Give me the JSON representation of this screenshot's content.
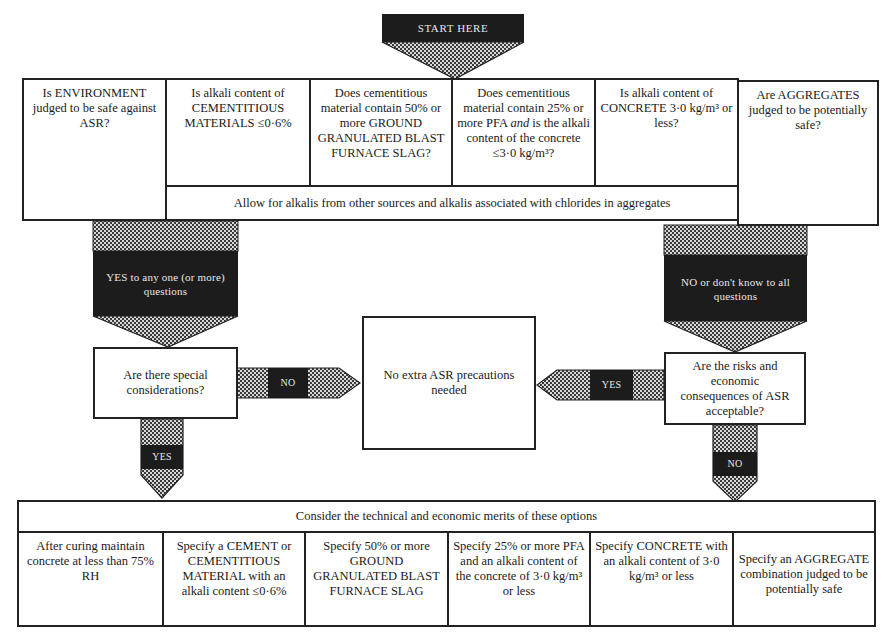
{
  "start": {
    "label": "START HERE"
  },
  "questions": [
    {
      "text": "Is ENVIRONMENT judged to be safe against ASR?"
    },
    {
      "text": "Is alkali content of CEMENTITIOUS MATERIALS ≤0·6%"
    },
    {
      "text": "Does cementitious material contain 50% or more GROUND GRANULATED BLAST FURNACE SLAG?"
    },
    {
      "text_before": "Does cementitious material contain 25% or more PFA ",
      "text_italic": "and",
      "text_after": " is the alkali content of the concrete ≤3·0 kg/m³?"
    },
    {
      "text": "Is alkali content of CONCRETE 3·0 kg/m³ or less?"
    },
    {
      "text": "Are AGGREGATES judged to be potentially safe?"
    }
  ],
  "allow_note": "Allow for alkalis from other sources and alkalis associated with chlorides in aggregates",
  "arrows": {
    "yes_any": "YES to any one (or more) questions",
    "no_all": "NO or don't know to all questions",
    "no_special": "NO",
    "yes_risks": "YES",
    "yes_special": "YES",
    "no_risks": "NO"
  },
  "decisions": {
    "special_considerations": "Are there special considerations?",
    "risks_acceptable": "Are the risks and economic consequences of ASR acceptable?"
  },
  "outcome": {
    "no_extra": "No extra ASR precautions needed"
  },
  "options_header": "Consider the technical and economic merits of these options",
  "options": [
    {
      "text": "After curing maintain concrete at less than 75% RH"
    },
    {
      "text": "Specify a CEMENT or CEMENTITIOUS MATERIAL with an alkali content ≤0·6%"
    },
    {
      "text": "Specify 50% or more GROUND GRANULATED BLAST FURNACE SLAG"
    },
    {
      "text": "Specify 25% or more PFA and an alkali content of the concrete of 3·0 kg/m³ or less"
    },
    {
      "text": "Specify CONCRETE with an alkali content of 3·0 kg/m³ or less"
    },
    {
      "text": "Specify an AGGREGATE combination judged to be potentially safe"
    }
  ],
  "colors": {
    "dark_fill": "#1c1c1c",
    "line": "#222222",
    "checker_a": "#3a3a3a",
    "checker_b": "#d8d8d8"
  }
}
